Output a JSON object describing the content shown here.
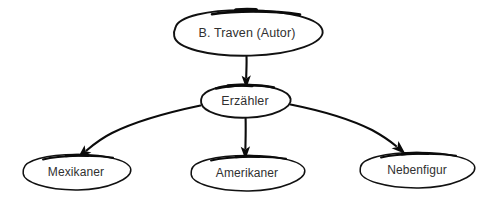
{
  "diagram": {
    "type": "directed-graph",
    "background_color": "#ffffff",
    "stroke_color": "#0b0b0b",
    "label_color": "#303030",
    "style": "hand-drawn-sketch",
    "nodes": [
      {
        "id": "autor",
        "label": "B. Traven (Autor)",
        "shape": "ellipse",
        "cx": 247,
        "cy": 33,
        "rx": 76,
        "ry": 23,
        "level": 0
      },
      {
        "id": "erzaehler",
        "label": "Erzähler",
        "shape": "ellipse",
        "cx": 245,
        "cy": 101,
        "rx": 45,
        "ry": 17,
        "level": 1
      },
      {
        "id": "mexikaner",
        "label": "Mexikaner",
        "shape": "ellipse",
        "cx": 76,
        "cy": 172,
        "rx": 54,
        "ry": 18,
        "level": 2
      },
      {
        "id": "amerikaner",
        "label": "Amerikaner",
        "shape": "ellipse",
        "cx": 247,
        "cy": 173,
        "rx": 57,
        "ry": 18,
        "level": 2
      },
      {
        "id": "nebenfigur",
        "label": "Nebenfigur",
        "shape": "ellipse",
        "cx": 417,
        "cy": 170,
        "rx": 58,
        "ry": 18,
        "level": 2
      }
    ],
    "edges": [
      {
        "id": "autor-erzaehler",
        "from": "autor",
        "to": "erzaehler",
        "shape": "straight",
        "direction": "down",
        "arrowhead": "solid-triangle"
      },
      {
        "id": "erzaehler-mexikaner",
        "from": "erzaehler",
        "to": "mexikaner",
        "shape": "curved",
        "direction": "down-left",
        "arrowhead": "solid-triangle"
      },
      {
        "id": "erzaehler-amerikaner",
        "from": "erzaehler",
        "to": "amerikaner",
        "shape": "straight",
        "direction": "down",
        "arrowhead": "solid-triangle"
      },
      {
        "id": "erzaehler-nebenfigur",
        "from": "erzaehler",
        "to": "nebenfigur",
        "shape": "curved",
        "direction": "down-right",
        "arrowhead": "solid-triangle"
      }
    ]
  }
}
